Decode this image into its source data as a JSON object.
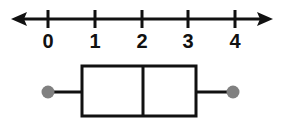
{
  "figure": {
    "background_color": "#ffffff",
    "width": 288,
    "height": 131
  },
  "colors": {
    "line": "#111111",
    "box_stroke": "#111111",
    "box_fill": "#ffffff",
    "whisker_dot": "#808080",
    "label_text": "#111111"
  },
  "number_line": {
    "name": "number-line",
    "axis_y": 19,
    "left_arrow_x": 11,
    "right_arrow_x": 273,
    "has_left_arrow": true,
    "has_right_arrow": true,
    "tick_half_height": 9,
    "ticks": [
      {
        "label": "0",
        "value": 0,
        "x": 48
      },
      {
        "label": "1",
        "value": 1,
        "x": 95
      },
      {
        "label": "2",
        "value": 2,
        "x": 142
      },
      {
        "label": "3",
        "value": 3,
        "x": 188
      },
      {
        "label": "4",
        "value": 4,
        "x": 235
      }
    ],
    "label_baseline_y": 48
  },
  "chart_data": {
    "type": "boxplot",
    "title": "",
    "xlabel": "",
    "ylabel": "",
    "xlim": [
      -0.8,
      5.0
    ],
    "xticks": [
      0,
      1,
      2,
      3,
      4
    ],
    "xticklabels": [
      "0",
      "1",
      "2",
      "3",
      "4"
    ],
    "grid": false,
    "legend": null,
    "orientation": "horizontal",
    "series": [
      {
        "name": "data",
        "minimum": 0,
        "q1": 0.73,
        "median": 2.03,
        "q3": 3.17,
        "maximum": 3.96,
        "whisker_marker": "filled-circle",
        "whisker_marker_radius": 6.5,
        "box_top_y": 66,
        "box_bottom_y": 116,
        "center_line_y": 92,
        "px": {
          "whisker_left_x": 48,
          "box_left_x": 82,
          "median_x": 143,
          "box_right_x": 196,
          "whisker_right_x": 233
        }
      }
    ]
  }
}
